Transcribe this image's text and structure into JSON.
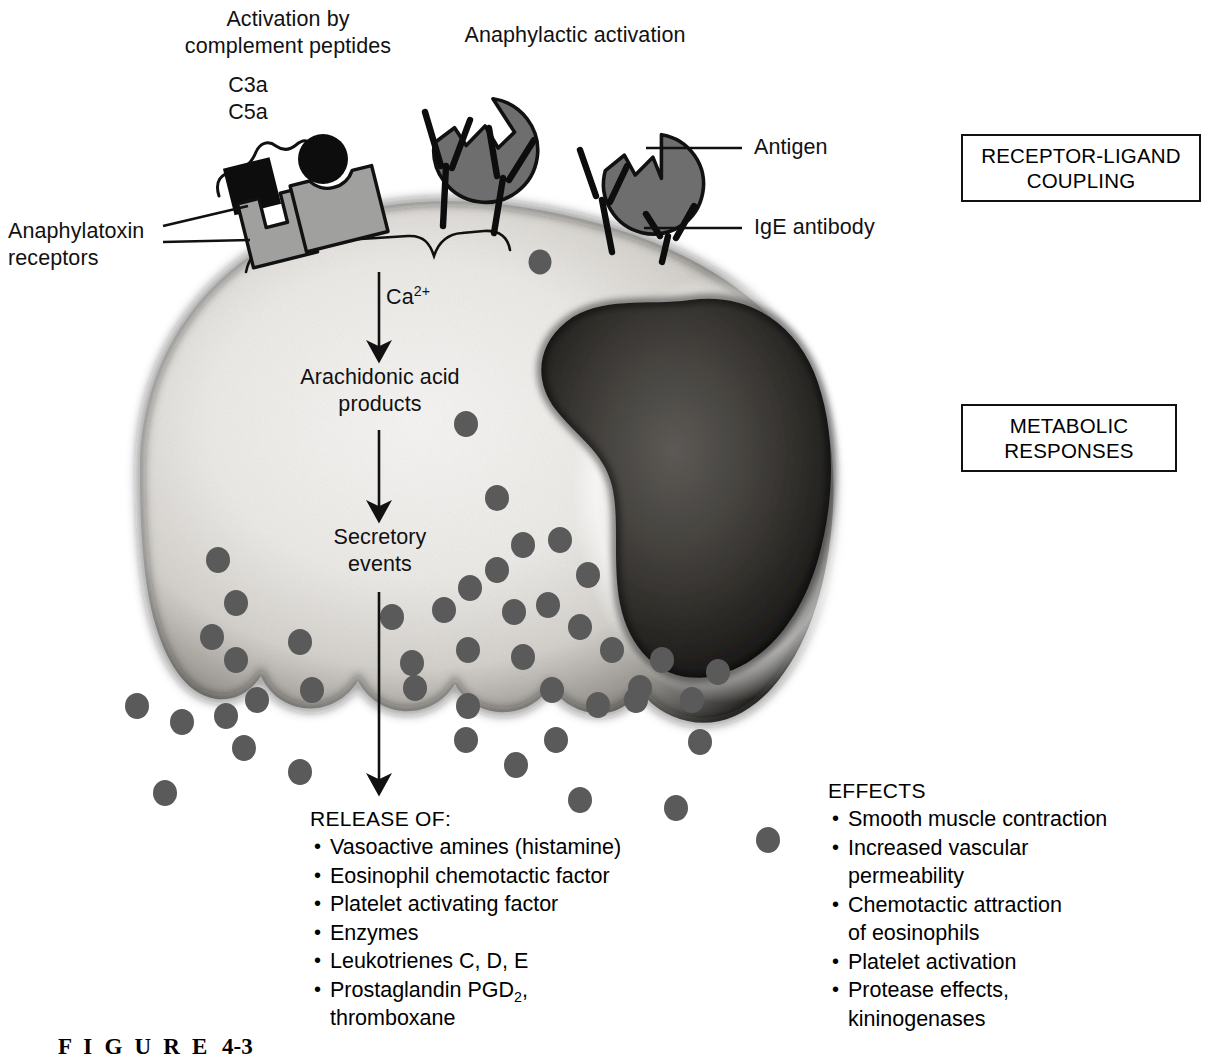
{
  "figure": {
    "caption_label": "F I G U R E",
    "caption_number": "4-3"
  },
  "headings": {
    "complement_activation_line1": "Activation by",
    "complement_activation_line2": "complement peptides",
    "anaphylactic_activation": "Anaphylactic activation"
  },
  "ligands": {
    "c3a": "C3a",
    "c5a": "C5a"
  },
  "callouts": {
    "anaphylatoxin_receptors_line1": "Anaphylatoxin",
    "anaphylatoxin_receptors_line2": "receptors",
    "antigen": "Antigen",
    "ige_antibody": "IgE antibody"
  },
  "boxes": [
    {
      "line1": "RECEPTOR-LIGAND",
      "line2": "COUPLING"
    },
    {
      "line1": "METABOLIC",
      "line2": "RESPONSES"
    }
  ],
  "pathway": {
    "calcium_prefix": "Ca",
    "calcium_super": "2+",
    "arachidonic_line1": "Arachidonic acid",
    "arachidonic_line2": "products",
    "secretory_line1": "Secretory",
    "secretory_line2": "events"
  },
  "release": {
    "heading": "RELEASE OF:",
    "items": [
      {
        "text": "Vasoactive amines (histamine)"
      },
      {
        "text": "Eosinophil chemotactic factor"
      },
      {
        "text": "Platelet activating factor"
      },
      {
        "text": "Enzymes"
      },
      {
        "text": "Leukotrienes C, D, E"
      },
      {
        "text": "Prostaglandin PGD",
        "sub": "2",
        "tail": ",",
        "cont": "thromboxane"
      }
    ]
  },
  "effects": {
    "heading": "EFFECTS",
    "items": [
      {
        "text": "Smooth muscle contraction"
      },
      {
        "text": "Increased vascular",
        "cont": "permeability"
      },
      {
        "text": "Chemotactic attraction",
        "cont": "of eosinophils"
      },
      {
        "text": "Platelet activation"
      },
      {
        "text": "Protease effects,",
        "cont": "kininogenases"
      }
    ]
  },
  "colors": {
    "ink": "#111111",
    "granule": "#5a5a5a",
    "antigen_fill": "#6e6e6e",
    "receptor_fill": "#9a9a9a",
    "cytoplasm_light": "#f0f0ee",
    "cell_edge": "#2b2b2b",
    "nucleus_dark": "#2a2a2a",
    "page_bg": "#ffffff"
  }
}
